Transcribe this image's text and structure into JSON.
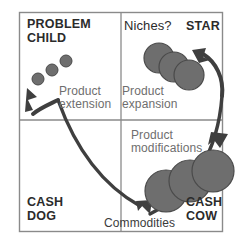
{
  "diagram": {
    "frame_color": "#8a8a8a",
    "circle_fill": "#6e6e6e",
    "circle_stroke": "#4a4a4a",
    "arrow_color": "#3f3f3f",
    "quadrants": [
      {
        "id": "problem-child",
        "label": "PROBLEM\nCHILD",
        "style": "bold"
      },
      {
        "id": "niches",
        "label": "Niches?",
        "style": "soft"
      },
      {
        "id": "star",
        "label": "STAR",
        "style": "bold"
      },
      {
        "id": "cash-dog",
        "label": "CASH\nDOG",
        "style": "bold"
      },
      {
        "id": "cash-cow",
        "label": "CASH\nCOW",
        "style": "bold"
      }
    ],
    "annotations": [
      {
        "id": "product-extension",
        "label": "Product\nextension"
      },
      {
        "id": "product-expansion",
        "label": "Product\nexpansion"
      },
      {
        "id": "product-modifications",
        "label": "Product\nmodifications"
      },
      {
        "id": "commodities",
        "label": "Commodities"
      }
    ],
    "circle_groups": [
      {
        "id": "problem-child-circles",
        "radius": 6,
        "centers": [
          [
            38,
            79
          ],
          [
            52,
            70
          ],
          [
            66,
            61
          ]
        ]
      },
      {
        "id": "star-circles",
        "radius": 15,
        "centers": [
          [
            159,
            58
          ],
          [
            174,
            67
          ],
          [
            189,
            75
          ]
        ]
      },
      {
        "id": "cash-cow-circles",
        "radius": 21,
        "centers": [
          [
            166,
            191
          ],
          [
            190,
            181
          ],
          [
            213,
            171
          ]
        ]
      }
    ]
  }
}
